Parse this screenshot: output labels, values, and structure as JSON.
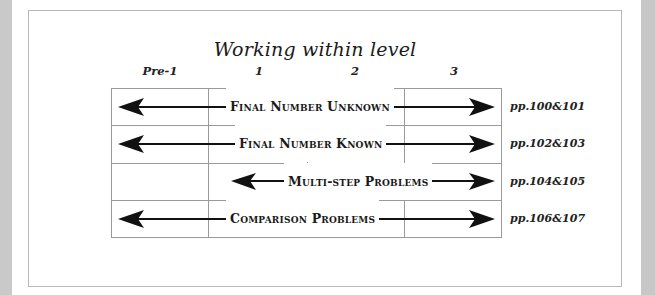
{
  "diagram": {
    "title": "Working within level",
    "levels": [
      "Pre-1",
      "1",
      "2",
      "3"
    ],
    "rows": [
      {
        "label": "Final Number Unknown",
        "span": [
          "Pre-1",
          "3"
        ],
        "pages": "pp.100&101"
      },
      {
        "label": "Final Number Known",
        "span": [
          "Pre-1",
          "3"
        ],
        "pages": "pp.102&103"
      },
      {
        "label": "Multi-step Problems",
        "span": [
          "1",
          "3"
        ],
        "pages": "pp.104&105"
      },
      {
        "label": "Comparison Problems",
        "span": [
          "Pre-1",
          "3"
        ],
        "pages": "pp.106&107"
      }
    ]
  },
  "colors": {
    "arrow": "#111111",
    "grid": "#9a9a9a",
    "side_panel": "#c9c9c9"
  }
}
